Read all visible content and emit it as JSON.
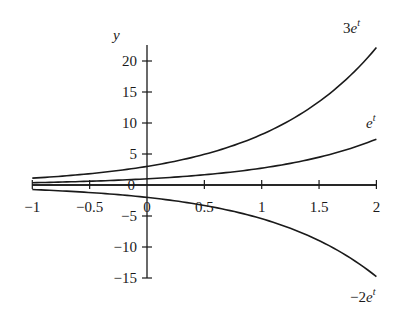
{
  "chart_data": {
    "type": "line",
    "title": "",
    "xlabel": "",
    "ylabel": "y",
    "xlim": [
      -1,
      2
    ],
    "ylim": [
      -15,
      22.2
    ],
    "x_ticks": [
      -1,
      -0.5,
      0,
      0.5,
      1,
      1.5,
      2
    ],
    "x_tick_labels": [
      "−1",
      "−0.5",
      "0",
      "0.5",
      "1",
      "1.5",
      "2"
    ],
    "y_ticks": [
      -15,
      -10,
      -5,
      0,
      5,
      10,
      15,
      20
    ],
    "y_tick_labels": [
      "−15",
      "−10",
      "−5",
      "0",
      "5",
      "10",
      "15",
      "20"
    ],
    "grid": false,
    "legend": "inline labels at right end of curves",
    "series": [
      {
        "name": "3e^t",
        "label_main": "3e",
        "label_sup": "t",
        "coefficient": 3,
        "x": [
          -1,
          -0.5,
          0,
          0.5,
          1,
          1.5,
          2
        ],
        "values": [
          1.1,
          1.82,
          3.0,
          4.95,
          8.15,
          13.45,
          22.17
        ]
      },
      {
        "name": "e^t",
        "label_main": "e",
        "label_sup": "t",
        "coefficient": 1,
        "x": [
          -1,
          -0.5,
          0,
          0.5,
          1,
          1.5,
          2
        ],
        "values": [
          0.37,
          0.61,
          1.0,
          1.65,
          2.72,
          4.48,
          7.39
        ]
      },
      {
        "name": "-2e^t",
        "label_main": "−2e",
        "label_sup": "t",
        "coefficient": -2,
        "x": [
          -1,
          -0.5,
          0,
          0.5,
          1,
          1.5,
          2
        ],
        "values": [
          -0.74,
          -1.21,
          -2.0,
          -3.3,
          -5.44,
          -8.96,
          -14.78
        ]
      },
      {
        "name": "y=0",
        "label_main": "0",
        "label_sup": "",
        "coefficient": 0,
        "x": [
          -1,
          2
        ],
        "values": [
          0,
          0
        ]
      }
    ]
  },
  "axis": {
    "y_label": "y"
  }
}
